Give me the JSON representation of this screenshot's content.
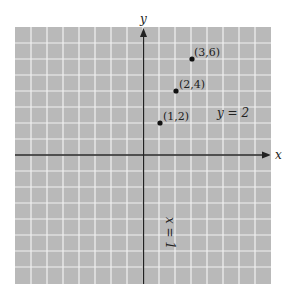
{
  "chart_data": {
    "type": "scatter",
    "title": "",
    "xlabel": "x",
    "ylabel": "y",
    "xlim": [
      -8,
      8
    ],
    "ylim": [
      -8,
      8
    ],
    "grid": true,
    "points": [
      {
        "x": 1,
        "y": 2,
        "label": "(1,2)"
      },
      {
        "x": 2,
        "y": 4,
        "label": "(2,4)"
      },
      {
        "x": 3,
        "y": 6,
        "label": "(3,6)"
      }
    ],
    "annotations": [
      {
        "text": "y = 2",
        "x": 5,
        "y": 2.5
      },
      {
        "text": "x = 1",
        "x": 1.6,
        "y": -5,
        "rotation": 90
      }
    ]
  },
  "labels": {
    "x_axis": "x",
    "y_axis": "y",
    "p1": "(1,2)",
    "p2": "(2,4)",
    "p3": "(3,6)",
    "eq_y": "y = 2",
    "eq_x": "x = 1"
  },
  "colors": {
    "grid_bg": "#b9b9b9",
    "grid_line": "#f2f2f2",
    "axis": "#222222"
  }
}
